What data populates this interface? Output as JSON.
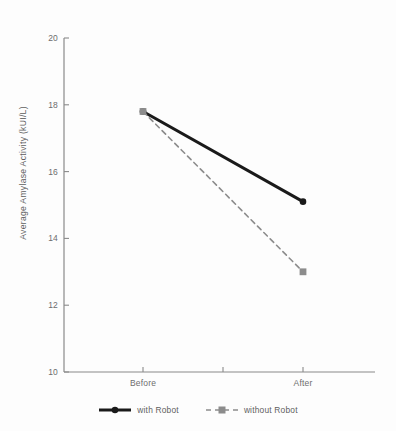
{
  "chart_data": {
    "type": "line",
    "title": "",
    "xlabel": "",
    "ylabel": "Average Amylase Activity (kUI/L)",
    "categories": [
      "Before",
      "After"
    ],
    "series": [
      {
        "name": "with Robot",
        "values": [
          17.8,
          15.1
        ],
        "color": "#1a1a1a",
        "line_style": "solid",
        "marker": "circle"
      },
      {
        "name": "without Robot",
        "values": [
          17.8,
          13.0
        ],
        "color": "#8c8c8c",
        "line_style": "dashed",
        "marker": "square"
      }
    ],
    "ylim": [
      10,
      20
    ],
    "yticks": [
      10,
      12,
      14,
      16,
      18,
      20
    ],
    "ytick_labels": [
      "10",
      "12",
      "14",
      "16",
      "18",
      "20"
    ],
    "grid": false,
    "legend_position": "bottom-center"
  },
  "axes": {
    "axis_color": "#8a8a8a",
    "tick_color": "#8a8a8a",
    "label_color": "#6d6d6d"
  }
}
